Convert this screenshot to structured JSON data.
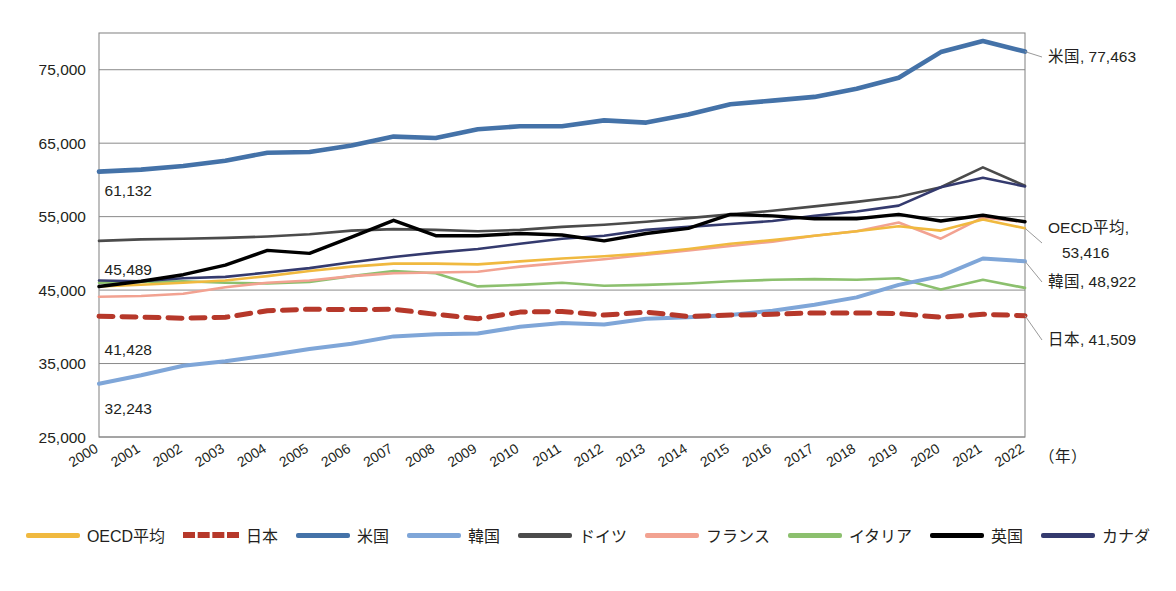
{
  "chart_data": {
    "type": "line",
    "title": "",
    "xlabel": "（年）",
    "ylabel": "",
    "ylim": [
      25000,
      80000
    ],
    "yticks": [
      "25,000",
      "35,000",
      "45,000",
      "55,000",
      "65,000",
      "75,000"
    ],
    "ytick_values": [
      25000,
      35000,
      45000,
      55000,
      65000,
      75000
    ],
    "grid": true,
    "legend_position": "bottom",
    "categories": [
      "2000",
      "2001",
      "2002",
      "2003",
      "2004",
      "2005",
      "2006",
      "2007",
      "2008",
      "2009",
      "2010",
      "2011",
      "2012",
      "2013",
      "2014",
      "2015",
      "2016",
      "2017",
      "2018",
      "2019",
      "2020",
      "2021",
      "2022"
    ],
    "series": [
      {
        "name": "OECD平均",
        "color": "#F0B93F",
        "style": "solid",
        "values": [
          45489,
          45720,
          46000,
          46300,
          46900,
          47600,
          48200,
          48600,
          48600,
          48500,
          48900,
          49300,
          49600,
          50000,
          50600,
          51300,
          51800,
          52400,
          53000,
          53700,
          53100,
          54600,
          53416
        ]
      },
      {
        "name": "日本",
        "color": "#B6382A",
        "style": "dashed",
        "values": [
          41428,
          41320,
          41180,
          41300,
          42200,
          42400,
          42350,
          42400,
          41700,
          41100,
          42000,
          42100,
          41600,
          42000,
          41400,
          41600,
          41700,
          41900,
          41900,
          41800,
          41300,
          41700,
          41509
        ]
      },
      {
        "name": "米国",
        "color": "#4472A8",
        "style": "solid",
        "values": [
          61132,
          61400,
          61900,
          62600,
          63700,
          63800,
          64700,
          65900,
          65700,
          66900,
          67300,
          67300,
          68100,
          67800,
          68900,
          70300,
          70800,
          71300,
          72400,
          73900,
          77400,
          78900,
          77463
        ]
      },
      {
        "name": "韓国",
        "color": "#7FA6D8",
        "style": "solid",
        "values": [
          32243,
          33400,
          34700,
          35300,
          36100,
          37000,
          37700,
          38700,
          39000,
          39100,
          40000,
          40500,
          40300,
          41100,
          41300,
          41600,
          42200,
          43000,
          44000,
          45700,
          46900,
          49300,
          48922
        ]
      },
      {
        "name": "ドイツ",
        "color": "#4B4B4B",
        "style": "solid",
        "values": [
          51700,
          51900,
          52000,
          52100,
          52300,
          52600,
          53100,
          53300,
          53200,
          53000,
          53200,
          53600,
          53900,
          54300,
          54800,
          55300,
          55800,
          56400,
          57000,
          57700,
          59000,
          61700,
          59200
        ]
      },
      {
        "name": "フランス",
        "color": "#F2A291",
        "style": "solid",
        "values": [
          44100,
          44200,
          44500,
          45400,
          46000,
          46300,
          46900,
          47300,
          47400,
          47500,
          48200,
          48700,
          49200,
          49800,
          50400,
          51000,
          51600,
          52400,
          53000,
          54200,
          52000,
          54900,
          54300
        ]
      },
      {
        "name": "イタリア",
        "color": "#8CC06E",
        "style": "solid",
        "values": [
          46000,
          46100,
          46200,
          46000,
          45900,
          46100,
          46900,
          47600,
          47300,
          45500,
          45700,
          46000,
          45600,
          45700,
          45900,
          46200,
          46400,
          46500,
          46400,
          46600,
          45100,
          46400,
          45300
        ]
      },
      {
        "name": "英国",
        "color": "#000000",
        "style": "solid",
        "values": [
          45489,
          46200,
          47100,
          48400,
          50400,
          50000,
          52200,
          54500,
          52400,
          52400,
          52700,
          52500,
          51700,
          52700,
          53400,
          55300,
          55100,
          54700,
          54700,
          55300,
          54400,
          55200,
          54300
        ]
      },
      {
        "name": "カナダ",
        "color": "#343A6E",
        "style": "solid",
        "values": [
          46300,
          46200,
          46600,
          46800,
          47400,
          48000,
          48800,
          49500,
          50100,
          50600,
          51300,
          52000,
          52400,
          53200,
          53600,
          54000,
          54400,
          55100,
          55700,
          56500,
          59000,
          60300,
          59100
        ]
      }
    ],
    "left_annotations": [
      {
        "text": "61,132",
        "series": "米国"
      },
      {
        "text": "45,489",
        "series": "OECD平均"
      },
      {
        "text": "41,428",
        "series": "日本"
      },
      {
        "text": "32,243",
        "series": "韓国"
      }
    ],
    "right_annotations": [
      {
        "text": "米国, 77,463",
        "series": "米国"
      },
      {
        "text": "OECD平均,",
        "text2": "53,416",
        "series": "OECD平均"
      },
      {
        "text": "韓国, 48,922",
        "series": "韓国"
      },
      {
        "text": "日本, 41,509",
        "series": "日本"
      }
    ]
  },
  "legend": {
    "items": [
      {
        "label": "OECD平均",
        "color": "#F0B93F",
        "style": "solid"
      },
      {
        "label": "日本",
        "color": "#B6382A",
        "style": "dashed"
      },
      {
        "label": "米国",
        "color": "#4472A8",
        "style": "solid"
      },
      {
        "label": "韓国",
        "color": "#7FA6D8",
        "style": "solid"
      },
      {
        "label": "ドイツ",
        "color": "#4B4B4B",
        "style": "solid"
      },
      {
        "label": "フランス",
        "color": "#F2A291",
        "style": "solid"
      },
      {
        "label": "イタリア",
        "color": "#8CC06E",
        "style": "solid"
      },
      {
        "label": "英国",
        "color": "#000000",
        "style": "solid"
      },
      {
        "label": "カナダ",
        "color": "#343A6E",
        "style": "solid"
      }
    ]
  },
  "caption": {
    "text": ""
  }
}
